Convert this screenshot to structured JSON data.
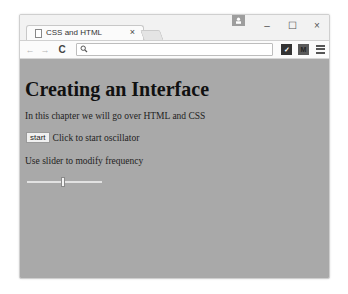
{
  "browser": {
    "tabs": [
      {
        "label": "CSS and HTML",
        "icon": "page-icon",
        "active": true
      }
    ],
    "window_controls": {
      "minimize": "–",
      "maximize": "☐",
      "close": "×"
    },
    "tab_close": "×",
    "toolbar": {
      "back": "←",
      "forward": "→",
      "reload": "C",
      "address_value": "",
      "extensions": [
        {
          "name": "checkmark-extension",
          "glyph": "✓"
        },
        {
          "name": "m-extension",
          "glyph": "M"
        }
      ],
      "menu_icon": "hamburger-menu"
    }
  },
  "page": {
    "background": "#a9a9a9",
    "heading": "Creating an Interface",
    "intro": "In this chapter we will go over HTML and CSS",
    "start_button": "start",
    "start_text": "Click to start oscillator",
    "slider_label": "Use slider to modify frequency",
    "slider": {
      "min": 0,
      "max": 100,
      "value": 50
    }
  }
}
